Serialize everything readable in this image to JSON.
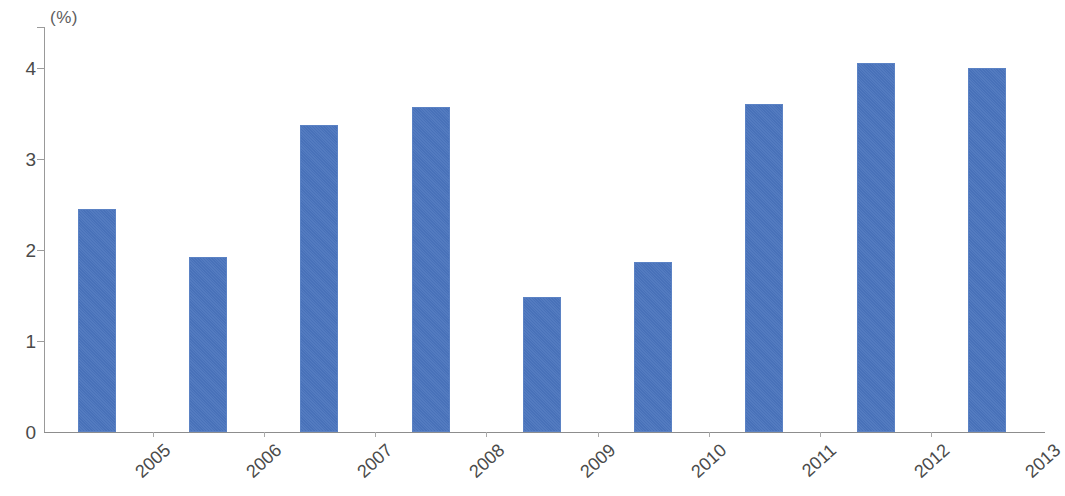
{
  "chart_data": {
    "type": "bar",
    "title": "",
    "subtitle": "",
    "xlabel": "",
    "ylabel": "(%)",
    "unit_label": "(%)",
    "categories": [
      "2005",
      "2006",
      "2007",
      "2008",
      "2009",
      "2010",
      "2011",
      "2012",
      "2013"
    ],
    "values": [
      2.45,
      1.92,
      3.37,
      3.57,
      1.48,
      1.87,
      3.6,
      4.05,
      4.0
    ],
    "series": [
      {
        "name": "",
        "values": [
          2.45,
          1.92,
          3.37,
          3.57,
          1.48,
          1.87,
          3.6,
          4.05,
          4.0
        ],
        "color": "#4a74bd"
      }
    ],
    "ylim": [
      0,
      4.45
    ],
    "yticks": [
      0,
      1,
      2,
      3,
      4
    ],
    "ytick_labels": [
      "0",
      "1",
      "2",
      "3",
      "4"
    ],
    "grid": false,
    "legend": null,
    "legend_position": "none",
    "xtick_rotation": -42,
    "bar_color": "#4a74bd",
    "bar_edge_color": "#5b82c4",
    "axis_color": "#8d8d8d",
    "text_color": "#4a4a4a",
    "background": "#ffffff"
  }
}
